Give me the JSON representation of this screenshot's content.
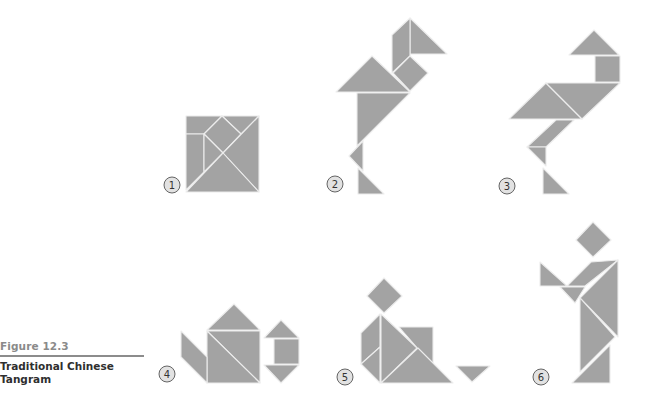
{
  "caption": {
    "figure_label": "Figure 12.3",
    "title": "Traditional Chinese Tangram"
  },
  "colors": {
    "piece_fill": "#a3a3a3",
    "piece_edge": "#ececec",
    "badge_fill": "#e2e2e2",
    "badge_stroke": "#555555",
    "label_gray": "#8a8a8a",
    "title_dark": "#2f2f2f"
  },
  "panels": [
    {
      "id": 1,
      "label": "1",
      "subject": "square"
    },
    {
      "id": 2,
      "label": "2",
      "subject": "bird"
    },
    {
      "id": 3,
      "label": "3",
      "subject": "bird"
    },
    {
      "id": 4,
      "label": "4",
      "subject": "teapot"
    },
    {
      "id": 5,
      "label": "5",
      "subject": "seated figure"
    },
    {
      "id": 6,
      "label": "6",
      "subject": "standing figure"
    }
  ]
}
